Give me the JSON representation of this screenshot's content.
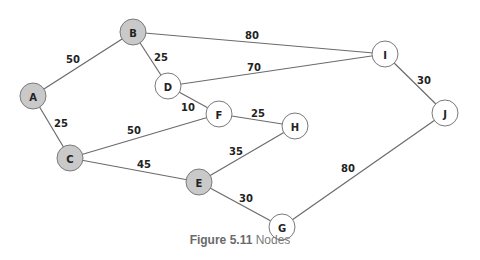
{
  "figure": {
    "caption_number": "Figure 5.11",
    "caption_text": "Nodes"
  },
  "colors": {
    "shaded_node": "#c9c9c9",
    "plain_node": "#ffffff",
    "edge": "#6b6b6b",
    "node_border": "#7a7a7a"
  },
  "nodes": [
    {
      "id": "A",
      "x": 33,
      "y": 96,
      "shaded": true
    },
    {
      "id": "B",
      "x": 133,
      "y": 32,
      "shaded": true
    },
    {
      "id": "C",
      "x": 70,
      "y": 158,
      "shaded": true
    },
    {
      "id": "D",
      "x": 168,
      "y": 86,
      "shaded": false
    },
    {
      "id": "E",
      "x": 199,
      "y": 182,
      "shaded": true
    },
    {
      "id": "F",
      "x": 219,
      "y": 114,
      "shaded": false
    },
    {
      "id": "G",
      "x": 282,
      "y": 227,
      "shaded": false
    },
    {
      "id": "H",
      "x": 295,
      "y": 126,
      "shaded": false
    },
    {
      "id": "I",
      "x": 385,
      "y": 54,
      "shaded": false
    },
    {
      "id": "J",
      "x": 445,
      "y": 113,
      "shaded": false
    }
  ],
  "edges": [
    {
      "from": "A",
      "to": "B",
      "weight": "50",
      "lx": 73,
      "ly": 63
    },
    {
      "from": "A",
      "to": "C",
      "weight": "25",
      "lx": 61,
      "ly": 127
    },
    {
      "from": "B",
      "to": "D",
      "weight": "25",
      "lx": 161,
      "ly": 61
    },
    {
      "from": "B",
      "to": "I",
      "weight": "80",
      "lx": 252,
      "ly": 39
    },
    {
      "from": "D",
      "to": "I",
      "weight": "70",
      "lx": 254,
      "ly": 71
    },
    {
      "from": "D",
      "to": "F",
      "weight": "10",
      "lx": 188,
      "ly": 111
    },
    {
      "from": "F",
      "to": "H",
      "weight": "25",
      "lx": 258,
      "ly": 117
    },
    {
      "from": "C",
      "to": "F",
      "weight": "50",
      "lx": 134,
      "ly": 134
    },
    {
      "from": "C",
      "to": "E",
      "weight": "45",
      "lx": 144,
      "ly": 168
    },
    {
      "from": "E",
      "to": "H",
      "weight": "35",
      "lx": 236,
      "ly": 155
    },
    {
      "from": "E",
      "to": "G",
      "weight": "30",
      "lx": 246,
      "ly": 202
    },
    {
      "from": "I",
      "to": "J",
      "weight": "30",
      "lx": 424,
      "ly": 84
    },
    {
      "from": "J",
      "to": "G",
      "weight": "80",
      "lx": 348,
      "ly": 172
    }
  ]
}
